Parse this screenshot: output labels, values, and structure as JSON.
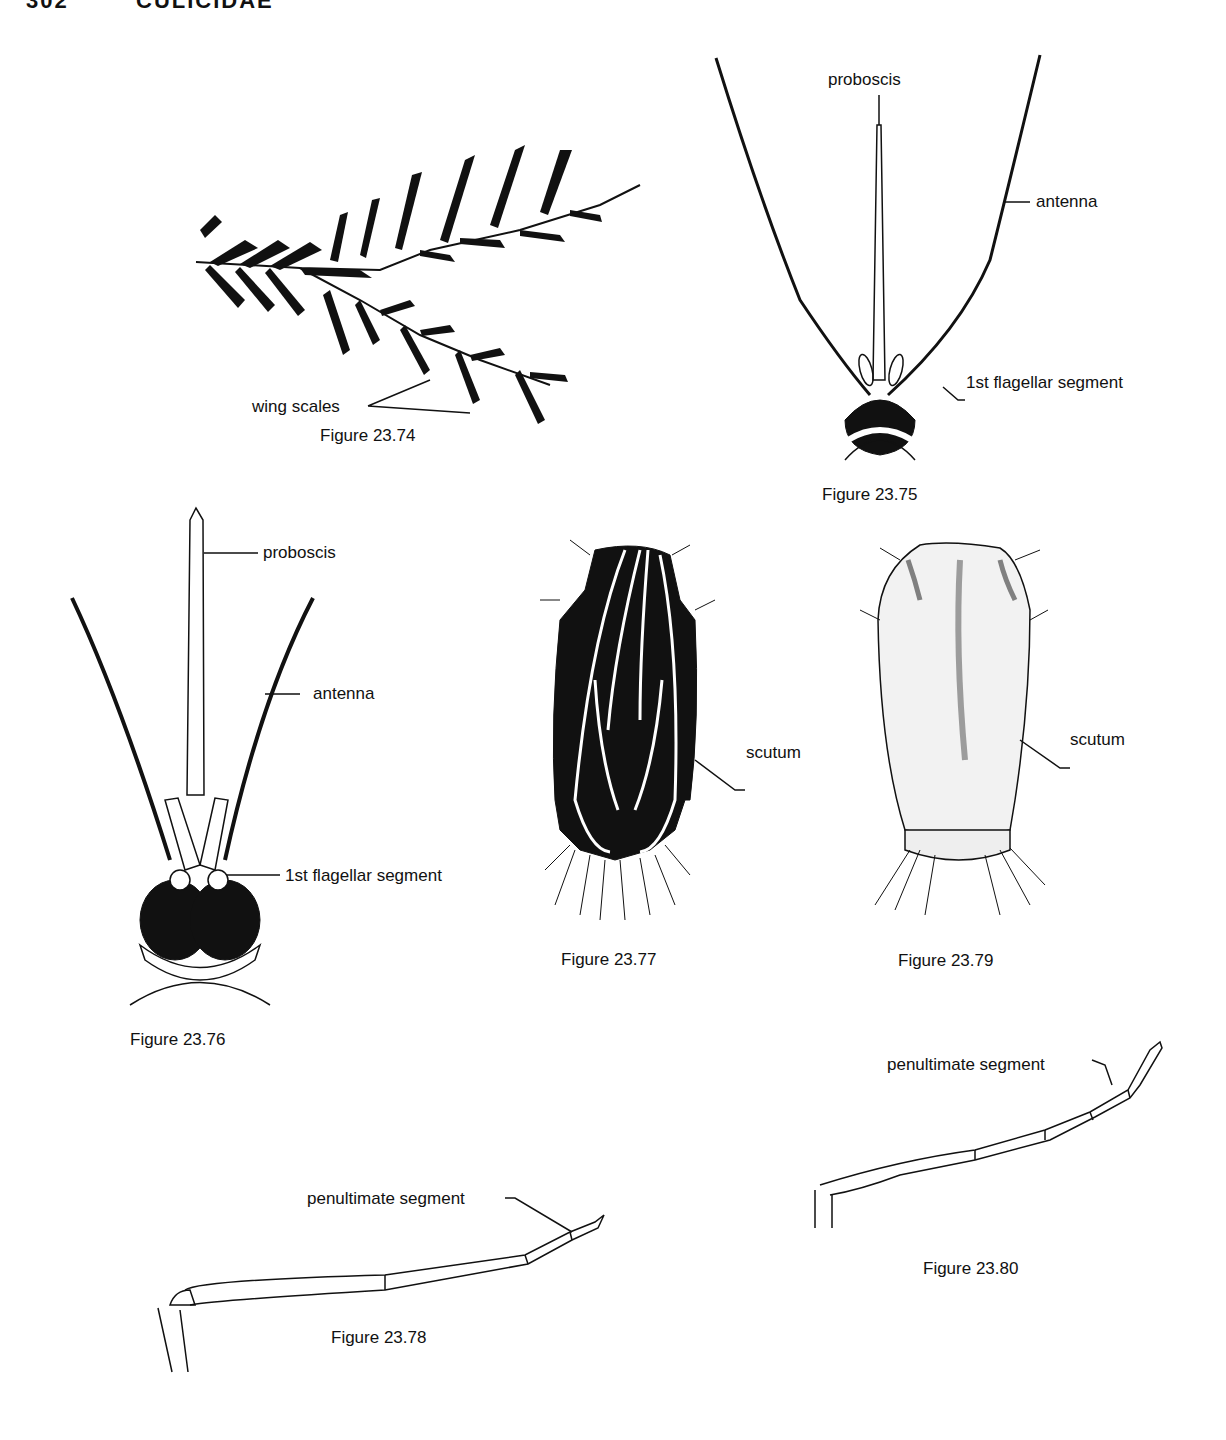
{
  "header": {
    "page_number": "302",
    "running_title": "CULICIDAE"
  },
  "figures": [
    {
      "id": "fig-23-74",
      "caption": "Figure 23.74",
      "labels": [
        "wing scales"
      ]
    },
    {
      "id": "fig-23-75",
      "caption": "Figure 23.75",
      "labels": [
        "proboscis",
        "antenna",
        "1st flagellar segment"
      ]
    },
    {
      "id": "fig-23-76",
      "caption": "Figure 23.76",
      "labels": [
        "proboscis",
        "antenna",
        "1st flagellar segment"
      ]
    },
    {
      "id": "fig-23-77",
      "caption": "Figure 23.77",
      "labels": [
        "scutum"
      ]
    },
    {
      "id": "fig-23-79",
      "caption": "Figure 23.79",
      "labels": [
        "scutum"
      ]
    },
    {
      "id": "fig-23-80",
      "caption": "Figure 23.80",
      "labels": [
        "penultimate segment"
      ]
    },
    {
      "id": "fig-23-78",
      "caption": "Figure 23.78",
      "labels": [
        "penultimate segment"
      ]
    }
  ]
}
